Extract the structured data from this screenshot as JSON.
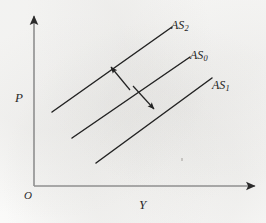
{
  "figure": {
    "kind": "aggregate-supply-shift-diagram",
    "background_color": "#fdfdfc",
    "ink_color": "#232323"
  },
  "axes": {
    "x_label": "Y",
    "y_label": "P",
    "origin_label": "O",
    "x_axis": {
      "x1": 34,
      "y1": 186,
      "x2": 258,
      "y2": 186,
      "arrow": "right"
    },
    "y_axis": {
      "x1": 34,
      "y1": 186,
      "x2": 34,
      "y2": 14,
      "arrow": "up"
    }
  },
  "chart_data": {
    "type": "line",
    "title": "",
    "xlabel": "Y",
    "ylabel": "P",
    "grid": false,
    "legend": "inline-end-labels",
    "series": [
      {
        "name": "AS2",
        "label": "AS",
        "subscript": "2",
        "description": "leftward/upward shifted aggregate supply curve",
        "points": [
          [
            52,
            112
          ],
          [
            172,
            27
          ]
        ]
      },
      {
        "name": "AS0",
        "label": "AS",
        "subscript": "0",
        "description": "initial aggregate supply curve",
        "points": [
          [
            72,
            138
          ],
          [
            190,
            57
          ]
        ]
      },
      {
        "name": "AS1",
        "label": "AS",
        "subscript": "1",
        "description": "rightward/downward shifted aggregate supply curve",
        "points": [
          [
            96,
            163
          ],
          [
            212,
            78
          ]
        ]
      }
    ],
    "annotations": [
      {
        "name": "shift-arrow-up-left",
        "type": "arrow",
        "from": [
          130,
          90
        ],
        "to": [
          111,
          67
        ],
        "meaning": "shift from AS0 to AS2"
      },
      {
        "name": "shift-arrow-down-right",
        "type": "arrow",
        "from": [
          133,
          86
        ],
        "to": [
          154,
          109
        ],
        "meaning": "shift from AS0 to AS1"
      }
    ]
  }
}
